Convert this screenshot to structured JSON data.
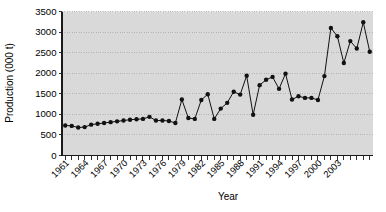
{
  "chart_data": {
    "type": "line",
    "title": "",
    "xlabel": "Year",
    "ylabel": "Production (000 t)",
    "xlim": [
      1961,
      2003
    ],
    "ylim": [
      0,
      3500
    ],
    "ytick_labels": [
      "0",
      "500",
      "1000",
      "1500",
      "2000",
      "2500",
      "3000",
      "3500"
    ],
    "ytick_values": [
      0,
      500,
      1000,
      1500,
      2000,
      2500,
      3000,
      3500
    ],
    "xtick_labels": [
      "1961",
      "1964",
      "1967",
      "1970",
      "1973",
      "1976",
      "1979",
      "1982",
      "1985",
      "1988",
      "1991",
      "1994",
      "1997",
      "2000",
      "2003"
    ],
    "xtick_values": [
      1961,
      1964,
      1967,
      1970,
      1973,
      1976,
      1979,
      1982,
      1985,
      1988,
      1991,
      1994,
      1997,
      2000,
      2003
    ],
    "grid": true,
    "legend": "none",
    "marker": "filled-circle",
    "x": [
      1961,
      1962,
      1963,
      1964,
      1965,
      1966,
      1967,
      1968,
      1969,
      1970,
      1971,
      1972,
      1973,
      1974,
      1975,
      1976,
      1977,
      1978,
      1979,
      1980,
      1981,
      1982,
      1983,
      1984,
      1985,
      1986,
      1987,
      1988,
      1989,
      1990,
      1991,
      1992,
      1993,
      1994,
      1995,
      1996,
      1997,
      1998,
      1999,
      2000,
      2001,
      2002,
      2003
    ],
    "categories": [
      "1961",
      "1962",
      "1963",
      "1964",
      "1965",
      "1966",
      "1967",
      "1968",
      "1969",
      "1970",
      "1971",
      "1972",
      "1973",
      "1974",
      "1975",
      "1976",
      "1977",
      "1978",
      "1979",
      "1980",
      "1981",
      "1982",
      "1983",
      "1984",
      "1985",
      "1986",
      "1987",
      "1988",
      "1989",
      "1990",
      "1991",
      "1992",
      "1993",
      "1994",
      "1995",
      "1996",
      "1997",
      "1998",
      "1999",
      "2000",
      "2001",
      "2002",
      "2003"
    ],
    "values": [
      730,
      720,
      680,
      690,
      750,
      770,
      790,
      810,
      830,
      840,
      860,
      880,
      890,
      940,
      850,
      850,
      840,
      790,
      1360,
      910,
      890,
      1350,
      1490,
      890,
      1140,
      1280,
      1550,
      1480,
      1940,
      990,
      1710,
      1840,
      1910,
      1620,
      1990,
      1360,
      1440,
      1400,
      1400,
      1350,
      1930,
      3100,
      2900
    ],
    "series": [
      {
        "name": "Production",
        "values": [
          730,
          720,
          680,
          690,
          750,
          770,
          790,
          810,
          830,
          840,
          860,
          880,
          890,
          940,
          850,
          850,
          840,
          790,
          1360,
          910,
          890,
          1350,
          1490,
          890,
          1140,
          1280,
          1550,
          1480,
          1940,
          990,
          1710,
          1840,
          1910,
          1620,
          1990,
          1360,
          1440,
          1400,
          1400,
          1350,
          1930,
          3100,
          2900
        ]
      }
    ],
    "points": [
      {
        "year": 1961,
        "value": 730
      },
      {
        "year": 1962,
        "value": 720
      },
      {
        "year": 1963,
        "value": 680
      },
      {
        "year": 1964,
        "value": 690
      },
      {
        "year": 1965,
        "value": 750
      },
      {
        "year": 1966,
        "value": 770
      },
      {
        "year": 1967,
        "value": 790
      },
      {
        "year": 1968,
        "value": 810
      },
      {
        "year": 1969,
        "value": 830
      },
      {
        "year": 1970,
        "value": 850
      },
      {
        "year": 1971,
        "value": 870
      },
      {
        "year": 1972,
        "value": 880
      },
      {
        "year": 1973,
        "value": 890
      },
      {
        "year": 1974,
        "value": 940
      },
      {
        "year": 1975,
        "value": 850
      },
      {
        "year": 1976,
        "value": 850
      },
      {
        "year": 1977,
        "value": 840
      },
      {
        "year": 1978,
        "value": 790
      },
      {
        "year": 1979,
        "value": 1360
      },
      {
        "year": 1980,
        "value": 910
      },
      {
        "year": 1981,
        "value": 890
      },
      {
        "year": 1982,
        "value": 1350
      },
      {
        "year": 1983,
        "value": 1490
      },
      {
        "year": 1984,
        "value": 890
      },
      {
        "year": 1985,
        "value": 1140
      },
      {
        "year": 1986,
        "value": 1280
      },
      {
        "year": 1987,
        "value": 1550
      },
      {
        "year": 1988,
        "value": 1480
      },
      {
        "year": 1989,
        "value": 1940
      },
      {
        "year": 1990,
        "value": 990
      },
      {
        "year": 1991,
        "value": 1710
      },
      {
        "year": 1992,
        "value": 1840
      },
      {
        "year": 1993,
        "value": 1910
      },
      {
        "year": 1994,
        "value": 1620
      },
      {
        "year": 1995,
        "value": 1990
      },
      {
        "year": 1996,
        "value": 1360
      },
      {
        "year": 1997,
        "value": 1440
      },
      {
        "year": 1998,
        "value": 1400
      },
      {
        "year": 1999,
        "value": 1400
      },
      {
        "year": 2000,
        "value": 1350
      },
      {
        "year": 2001,
        "value": 1930
      },
      {
        "year": 2002,
        "value": 3100
      },
      {
        "year": 2003,
        "value": 2900
      },
      {
        "year": 2004,
        "value": 2250
      },
      {
        "year": 2005,
        "value": 2780
      },
      {
        "year": 2006,
        "value": 2600
      },
      {
        "year": 2007,
        "value": 3240
      },
      {
        "year": 2008,
        "value": 2520
      }
    ]
  }
}
